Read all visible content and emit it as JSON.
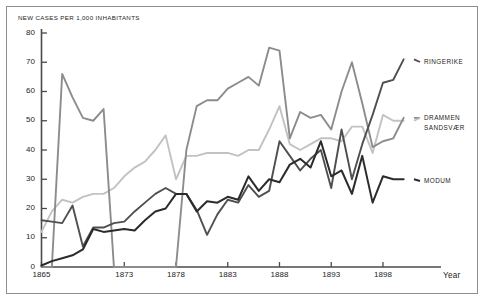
{
  "figure": {
    "frame_color": "#8e8e8e",
    "background": "#ffffff"
  },
  "axes": {
    "y_axis_title": "NEW CASES PER 1,000  INHABITANTS",
    "x_axis_title": "Year",
    "y_ticks": [
      "0",
      "10",
      "20",
      "30",
      "40",
      "50",
      "60",
      "70",
      "80"
    ],
    "x_ticks": [
      "1865",
      "1873",
      "1878",
      "1883",
      "1888",
      "1893",
      "1898"
    ],
    "axis_color": "#4a4a4a"
  },
  "series_labels": {
    "ringerike": "RINGERIKE",
    "drammen": "DRAMMEN",
    "sandsvaer": "SANDSVÆR",
    "modum": "MODUM"
  },
  "chart_data": {
    "type": "line",
    "title": "",
    "xlabel": "Year",
    "ylabel": "NEW CASES PER 1,000  INHABITANTS",
    "xlim": [
      1865,
      1901
    ],
    "ylim": [
      0,
      80
    ],
    "grid": false,
    "legend": "right-inline-labels",
    "x": [
      1865,
      1866,
      1867,
      1868,
      1869,
      1870,
      1871,
      1872,
      1873,
      1874,
      1875,
      1876,
      1877,
      1878,
      1879,
      1880,
      1881,
      1882,
      1883,
      1884,
      1885,
      1886,
      1887,
      1888,
      1889,
      1890,
      1891,
      1892,
      1893,
      1894,
      1895,
      1896,
      1897,
      1898,
      1899,
      1900
    ],
    "series": [
      {
        "name": "RINGERIKE",
        "color": "#4f4f4f",
        "values": [
          16,
          15.5,
          15,
          21,
          7,
          13.5,
          13.5,
          15,
          15.5,
          19,
          22,
          25,
          27,
          25,
          25,
          19.5,
          11,
          18,
          23,
          22,
          28,
          24,
          26,
          43,
          38,
          33,
          37,
          40,
          27,
          47,
          30,
          42,
          52,
          63,
          64,
          71
        ]
      },
      {
        "name": "DRAMMEN",
        "color": "#8c8c8c",
        "values": [
          0,
          0,
          66,
          58,
          51,
          50,
          54,
          0,
          0,
          0,
          0,
          0,
          0,
          0,
          40,
          55,
          57,
          57,
          61,
          63,
          65,
          62,
          75,
          74,
          44,
          53,
          51,
          52,
          47,
          60,
          70,
          56,
          41,
          43,
          44,
          51
        ]
      },
      {
        "name": "SANDSVÆR",
        "color": "#c2c2c2",
        "values": [
          12,
          19,
          23,
          22,
          24,
          25,
          25,
          27,
          31,
          34,
          36,
          40,
          45,
          30,
          38,
          38,
          39,
          39,
          39,
          38,
          40,
          40,
          47,
          55,
          42,
          40,
          42,
          44,
          44,
          43,
          48,
          48,
          39,
          52,
          50,
          50
        ]
      },
      {
        "name": "MODUM",
        "color": "#2b2b2b",
        "values": [
          0.5,
          2,
          3,
          4,
          6,
          13,
          12,
          12.5,
          13,
          12.5,
          16,
          19,
          20,
          25,
          25,
          19,
          22.5,
          22,
          24,
          23,
          31,
          26,
          30,
          29,
          35,
          37,
          34,
          43,
          31,
          33,
          25,
          38,
          22,
          31,
          30,
          30
        ]
      }
    ]
  }
}
